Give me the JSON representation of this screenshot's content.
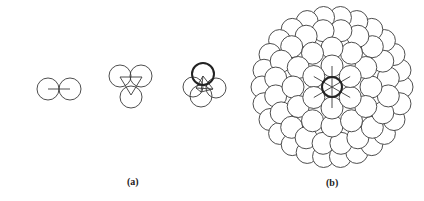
{
  "figure": {
    "panels": [
      {
        "id": "a",
        "label": "(a)"
      },
      {
        "id": "b",
        "label": "(b)"
      }
    ],
    "stroke_color": "#3a3a3a",
    "bold_stroke_color": "#222222",
    "background": "#ffffff"
  },
  "panel_a": {
    "label": "(a)",
    "clusters": [
      {
        "name": "dimer",
        "circles": [
          {
            "cx": 48,
            "cy": 89,
            "r": 11,
            "bold": false
          },
          {
            "cx": 70,
            "cy": 89,
            "r": 11,
            "bold": false
          }
        ],
        "bonds": [
          [
            48,
            89,
            70,
            89
          ]
        ]
      },
      {
        "name": "trimer",
        "circles": [
          {
            "cx": 120,
            "cy": 76,
            "r": 11,
            "bold": false
          },
          {
            "cx": 141,
            "cy": 76,
            "r": 11,
            "bold": false
          },
          {
            "cx": 131,
            "cy": 97,
            "r": 11,
            "bold": false
          }
        ],
        "bonds": [
          [
            120,
            77,
            142,
            77
          ],
          [
            142,
            77,
            131,
            95
          ],
          [
            131,
            95,
            120,
            77
          ]
        ]
      },
      {
        "name": "tetramer",
        "circles": [
          {
            "cx": 193,
            "cy": 87,
            "r": 10,
            "bold": false
          },
          {
            "cx": 216,
            "cy": 88,
            "r": 10,
            "bold": false
          },
          {
            "cx": 201,
            "cy": 96,
            "r": 11,
            "bold": false
          },
          {
            "cx": 203,
            "cy": 74,
            "r": 11,
            "bold": true
          }
        ],
        "bonds": [
          [
            203,
            76,
            196,
            88
          ],
          [
            203,
            76,
            213,
            89
          ],
          [
            203,
            76,
            201,
            92
          ],
          [
            196,
            88,
            213,
            89
          ],
          [
            213,
            89,
            201,
            92
          ],
          [
            201,
            92,
            196,
            88
          ]
        ]
      }
    ]
  },
  "panel_b": {
    "label": "(b)",
    "center": {
      "cx": 332,
      "cy": 87
    },
    "atom_radius": 11,
    "central_radius": 10,
    "rings": [
      {
        "dist": 70,
        "count": 26,
        "offset_deg": 0
      },
      {
        "dist": 57,
        "count": 20,
        "offset_deg": 9
      },
      {
        "dist": 39,
        "count": 12,
        "offset_deg": 0
      },
      {
        "dist": 21,
        "count": 6,
        "offset_deg": 90
      }
    ],
    "spokes": {
      "count": 6,
      "length": 21,
      "offset_deg": 90
    }
  }
}
